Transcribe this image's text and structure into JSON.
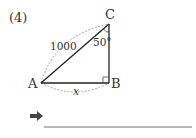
{
  "problem": {
    "number": "(4)"
  },
  "diagram": {
    "vertices": {
      "A": "A",
      "B": "B",
      "C": "C"
    },
    "hypotenuse_label": "1000",
    "angle_label": "50°",
    "unknown_label": "x",
    "right_angle_at": "B"
  },
  "answer": {
    "arrow_icon": "right-arrow",
    "value": ""
  }
}
